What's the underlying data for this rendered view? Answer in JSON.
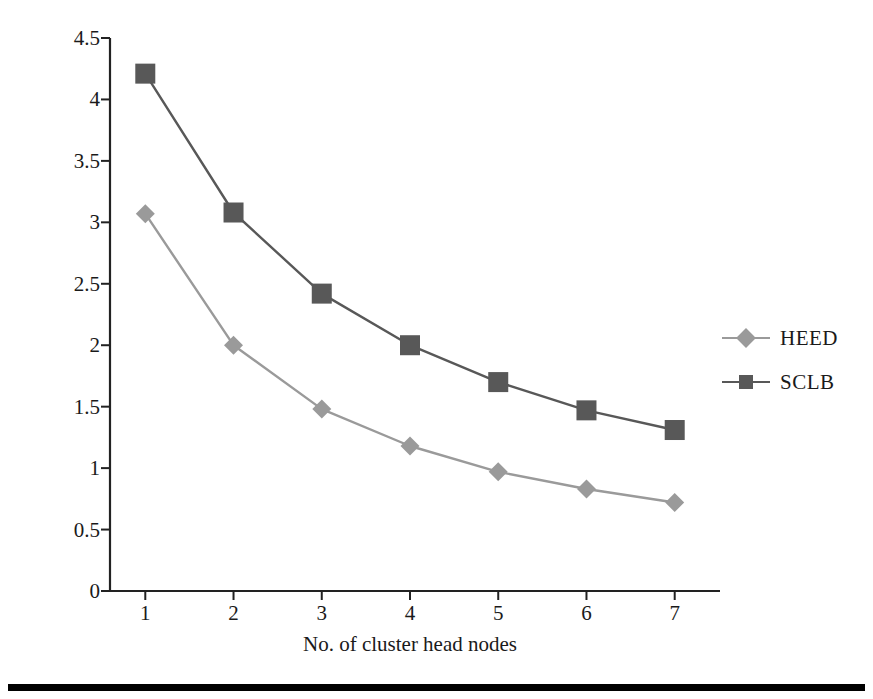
{
  "chart_data": {
    "type": "line",
    "title": "",
    "subtitle": "",
    "xlabel": "No. of cluster head nodes",
    "ylabel": "Network lifetime",
    "x": [
      1,
      2,
      3,
      4,
      5,
      6,
      7
    ],
    "categories": [
      "1",
      "2",
      "3",
      "4",
      "5",
      "6",
      "7"
    ],
    "xlim": [
      0.6,
      7.4
    ],
    "ylim": [
      0,
      4.5
    ],
    "xticks": [
      "1",
      "2",
      "3",
      "4",
      "5",
      "6",
      "7"
    ],
    "yticks": [
      "0",
      "0.5",
      "1",
      "1.5",
      "2",
      "2.5",
      "3",
      "3.5",
      "4",
      "4.5"
    ],
    "ytick_values": [
      0,
      0.5,
      1,
      1.5,
      2,
      2.5,
      3,
      3.5,
      4,
      4.5
    ],
    "grid": false,
    "legend_position": "right",
    "series": [
      {
        "name": "HEED",
        "marker": "diamond",
        "color": "#9a9a9a",
        "values": [
          3.07,
          2.0,
          1.48,
          1.18,
          0.97,
          0.83,
          0.72
        ]
      },
      {
        "name": "SCLB",
        "marker": "square",
        "color": "#585858",
        "values": [
          4.21,
          3.08,
          2.42,
          2.0,
          1.7,
          1.47,
          1.31
        ]
      }
    ]
  },
  "axes": {
    "x_title": "No. of cluster head nodes",
    "y_title": "Network lifetime",
    "axis_color": "#222222"
  },
  "legend": {
    "entries": [
      {
        "label": "HEED",
        "marker": "diamond",
        "color": "#9a9a9a"
      },
      {
        "label": "SCLB",
        "marker": "square",
        "color": "#585858"
      }
    ]
  },
  "page": {
    "background": "#ffffff",
    "rule_color": "#000000"
  }
}
